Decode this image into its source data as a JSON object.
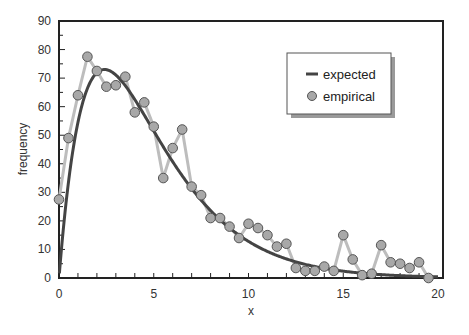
{
  "chart_data": {
    "type": "line",
    "title": "",
    "xlabel": "x",
    "ylabel": "frequency",
    "xlim": [
      0,
      20
    ],
    "ylim": [
      0,
      90
    ],
    "x_ticks": [
      0,
      5,
      10,
      15,
      20
    ],
    "y_ticks": [
      0,
      10,
      20,
      30,
      40,
      50,
      60,
      70,
      80,
      90
    ],
    "grid": false,
    "legend_position": "upper right",
    "legend": [
      {
        "label": "expected",
        "marker": "line",
        "color": "#444444"
      },
      {
        "label": "empirical",
        "marker": "circle",
        "color": "#a8a8a8"
      }
    ],
    "series": [
      {
        "name": "expected",
        "style": "smooth-curve",
        "color": "#444444",
        "model": {
          "form": "A*x*exp(-x/b)",
          "A": 82.7,
          "b": 2.4
        }
      },
      {
        "name": "empirical",
        "style": "line-with-markers",
        "color": "#bdbdbd",
        "marker_fill": "#a8a8a8",
        "x": [
          0,
          0.5,
          1,
          1.5,
          2,
          2.5,
          3,
          3.5,
          4,
          4.5,
          5,
          5.5,
          6,
          6.5,
          7,
          7.5,
          8,
          8.5,
          9,
          9.5,
          10,
          10.5,
          11,
          11.5,
          12,
          12.5,
          13,
          13.5,
          14,
          14.5,
          15,
          15.5,
          16,
          16.5,
          17,
          17.5,
          18,
          18.5,
          19,
          19.5
        ],
        "values": [
          27.5,
          49,
          64,
          77.5,
          72.5,
          67,
          67.5,
          70.5,
          58,
          61.5,
          53,
          35,
          45.5,
          52,
          32,
          29,
          21,
          21,
          18,
          14,
          19,
          17.5,
          15,
          11,
          12,
          3.5,
          2.5,
          2.5,
          4,
          2.5,
          15,
          6.5,
          1,
          1.5,
          11.5,
          5.5,
          5,
          3.5,
          5.5,
          0
        ]
      }
    ]
  }
}
